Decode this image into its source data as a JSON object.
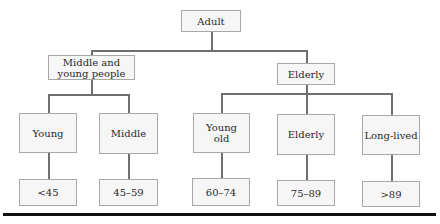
{
  "diagram": {
    "root": {
      "label": "Adult"
    },
    "groups": [
      {
        "label": "Middle and young people",
        "label_lines": [
          "Middle and",
          "young people"
        ],
        "children": [
          {
            "label": "Young",
            "range": "<45"
          },
          {
            "label": "Middle",
            "range": "45–59"
          }
        ]
      },
      {
        "label": "Elderly",
        "children": [
          {
            "label": "Young old",
            "label_lines": [
              "Young",
              "old"
            ],
            "range": "60–74"
          },
          {
            "label": "Elderly",
            "range": "75–89"
          },
          {
            "label": "Long-lived",
            "range": ">89"
          }
        ]
      }
    ],
    "colors": {
      "box_fill": "#f6f6f6",
      "box_border": "#a8a8a8",
      "connector": "#6f6f6f",
      "rule": "#111111"
    }
  }
}
